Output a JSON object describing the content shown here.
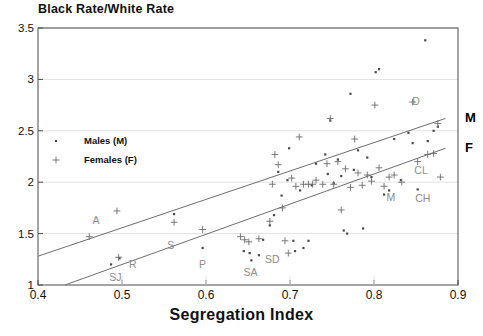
{
  "chart_data": {
    "type": "scatter",
    "title": "Black Rate/White Rate",
    "xlabel": "Segregation Index",
    "ylabel": "Black Rate/White Rate",
    "xlim": [
      0.4,
      0.9
    ],
    "ylim": [
      1,
      3.5
    ],
    "xticks": [
      "0.4",
      "0.5",
      "0.6",
      "0.7",
      "0.8",
      "0.9"
    ],
    "xtick_values": [
      0.4,
      0.5,
      0.6,
      0.7,
      0.8,
      0.9
    ],
    "yticks": [
      "1",
      "1.5",
      "2",
      "2.5",
      "3",
      "3.5"
    ],
    "ytick_values": [
      1,
      1.5,
      2,
      2.5,
      3,
      3.5
    ],
    "grid": "horizontal",
    "legend": {
      "position": "upper-left-inside",
      "entries": [
        {
          "label": "Males (M)",
          "marker": "dot"
        },
        {
          "label": "Females (F)",
          "marker": "plus"
        }
      ]
    },
    "series": [
      {
        "name": "Males (M)",
        "marker": "dot",
        "color": "#4a4a4a",
        "points": [
          [
            0.487,
            1.2
          ],
          [
            0.497,
            1.26
          ],
          [
            0.562,
            1.69
          ],
          [
            0.596,
            1.36
          ],
          [
            0.645,
            1.33
          ],
          [
            0.652,
            1.31
          ],
          [
            0.654,
            1.24
          ],
          [
            0.663,
            1.29
          ],
          [
            0.668,
            1.44
          ],
          [
            0.676,
            1.58
          ],
          [
            0.681,
            1.68
          ],
          [
            0.686,
            2.1
          ],
          [
            0.69,
            1.87
          ],
          [
            0.697,
            2.02
          ],
          [
            0.699,
            2.33
          ],
          [
            0.704,
            1.43
          ],
          [
            0.706,
            1.33
          ],
          [
            0.712,
            1.92
          ],
          [
            0.716,
            1.36
          ],
          [
            0.722,
            1.43
          ],
          [
            0.726,
            1.97
          ],
          [
            0.731,
            2.18
          ],
          [
            0.742,
            2.27
          ],
          [
            0.745,
            2.08
          ],
          [
            0.748,
            2.6
          ],
          [
            0.752,
            1.99
          ],
          [
            0.757,
            2.22
          ],
          [
            0.761,
            2.06
          ],
          [
            0.764,
            1.53
          ],
          [
            0.768,
            1.5
          ],
          [
            0.772,
            2.86
          ],
          [
            0.776,
            2.12
          ],
          [
            0.781,
            2.31
          ],
          [
            0.787,
            1.55
          ],
          [
            0.792,
            2.24
          ],
          [
            0.797,
            2.05
          ],
          [
            0.802,
            3.07
          ],
          [
            0.806,
            3.1
          ],
          [
            0.812,
            1.88
          ],
          [
            0.818,
            1.92
          ],
          [
            0.824,
            2.42
          ],
          [
            0.832,
            2.02
          ],
          [
            0.841,
            2.48
          ],
          [
            0.846,
            2.38
          ],
          [
            0.852,
            1.93
          ],
          [
            0.861,
            3.38
          ],
          [
            0.864,
            2.4
          ],
          [
            0.871,
            2.5
          ],
          [
            0.876,
            2.54
          ]
        ]
      },
      {
        "name": "Females (F)",
        "marker": "plus",
        "color": "#6b6b6b",
        "points": [
          [
            0.461,
            1.47
          ],
          [
            0.494,
            1.72
          ],
          [
            0.496,
            1.27
          ],
          [
            0.562,
            1.61
          ],
          [
            0.596,
            1.54
          ],
          [
            0.641,
            1.47
          ],
          [
            0.646,
            1.44
          ],
          [
            0.651,
            1.42
          ],
          [
            0.663,
            1.45
          ],
          [
            0.676,
            1.62
          ],
          [
            0.679,
            1.98
          ],
          [
            0.682,
            2.27
          ],
          [
            0.686,
            2.17
          ],
          [
            0.691,
            1.75
          ],
          [
            0.694,
            1.43
          ],
          [
            0.698,
            1.31
          ],
          [
            0.702,
            2.04
          ],
          [
            0.707,
            1.96
          ],
          [
            0.711,
            2.44
          ],
          [
            0.716,
            1.98
          ],
          [
            0.722,
            1.98
          ],
          [
            0.727,
            1.98
          ],
          [
            0.731,
            2.02
          ],
          [
            0.739,
            1.98
          ],
          [
            0.744,
            2.18
          ],
          [
            0.748,
            2.62
          ],
          [
            0.752,
            1.98
          ],
          [
            0.757,
            2.2
          ],
          [
            0.761,
            1.73
          ],
          [
            0.766,
            2.13
          ],
          [
            0.772,
            1.95
          ],
          [
            0.777,
            2.42
          ],
          [
            0.781,
            2.09
          ],
          [
            0.786,
            1.97
          ],
          [
            0.792,
            2.07
          ],
          [
            0.797,
            2.01
          ],
          [
            0.801,
            2.75
          ],
          [
            0.806,
            2.14
          ],
          [
            0.812,
            1.96
          ],
          [
            0.818,
            2.05
          ],
          [
            0.824,
            2.07
          ],
          [
            0.833,
            2.0
          ],
          [
            0.846,
            2.78
          ],
          [
            0.852,
            2.2
          ],
          [
            0.864,
            2.27
          ],
          [
            0.871,
            2.28
          ],
          [
            0.876,
            2.57
          ],
          [
            0.879,
            2.05
          ]
        ]
      }
    ],
    "trend_lines": [
      {
        "name": "M",
        "label": "M",
        "x_start": 0.4,
        "y_start": 1.28,
        "x_end": 0.885,
        "y_end": 2.62
      },
      {
        "name": "F",
        "label": "F",
        "x_start": 0.432,
        "y_start": 1.0,
        "x_end": 0.885,
        "y_end": 2.33
      }
    ],
    "annotations": [
      {
        "text": "A",
        "x": 0.469,
        "y": 1.63
      },
      {
        "text": "SJ",
        "x": 0.492,
        "y": 1.08
      },
      {
        "text": "R",
        "x": 0.513,
        "y": 1.2
      },
      {
        "text": "S",
        "x": 0.558,
        "y": 1.39
      },
      {
        "text": "P",
        "x": 0.596,
        "y": 1.2
      },
      {
        "text": "SA",
        "x": 0.653,
        "y": 1.13
      },
      {
        "text": "SD",
        "x": 0.679,
        "y": 1.25
      },
      {
        "text": "M",
        "x": 0.82,
        "y": 1.86
      },
      {
        "text": "CH",
        "x": 0.858,
        "y": 1.85
      },
      {
        "text": "CL",
        "x": 0.856,
        "y": 2.12
      },
      {
        "text": "D",
        "x": 0.85,
        "y": 2.79
      }
    ]
  },
  "colors": {
    "axis": "#4d4d4d",
    "grid": "#e2e2e2",
    "male_marker": "#4a4a4a",
    "female_marker": "#6b6b6b",
    "trend_line": "#6e6e6e",
    "annotation": "#8d8d8d",
    "text": "#111111"
  }
}
